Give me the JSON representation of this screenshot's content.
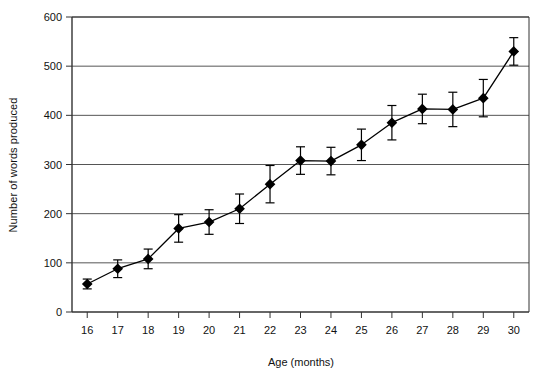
{
  "chart_data": {
    "type": "line",
    "title": "",
    "xlabel": "Age (months)",
    "ylabel": "Number of words produced",
    "x": [
      16,
      17,
      18,
      19,
      20,
      21,
      22,
      23,
      24,
      25,
      26,
      27,
      28,
      29,
      30
    ],
    "categories": [
      "16",
      "17",
      "18",
      "19",
      "20",
      "21",
      "22",
      "23",
      "24",
      "25",
      "26",
      "27",
      "28",
      "29",
      "30"
    ],
    "values": [
      57,
      88,
      108,
      170,
      183,
      210,
      260,
      308,
      307,
      340,
      385,
      413,
      412,
      435,
      530
    ],
    "error_bars": [
      10,
      18,
      20,
      28,
      25,
      30,
      38,
      28,
      28,
      32,
      35,
      30,
      35,
      38,
      28
    ],
    "series": [
      {
        "name": "Number of words produced",
        "values": [
          57,
          88,
          108,
          170,
          183,
          210,
          260,
          308,
          307,
          340,
          385,
          413,
          412,
          435,
          530
        ],
        "marker": "diamond",
        "color": "#000000"
      }
    ],
    "xlim": [
      15.5,
      30.5
    ],
    "ylim": [
      0,
      600
    ],
    "ytick_labels": [
      "0",
      "100",
      "200",
      "300",
      "400",
      "500",
      "600"
    ],
    "yticks": [
      0,
      100,
      200,
      300,
      400,
      500,
      600
    ],
    "grid": "horizontal",
    "grid_color": "#555555",
    "legend": "none",
    "frame_color": "#333333",
    "background": "#ffffff"
  }
}
